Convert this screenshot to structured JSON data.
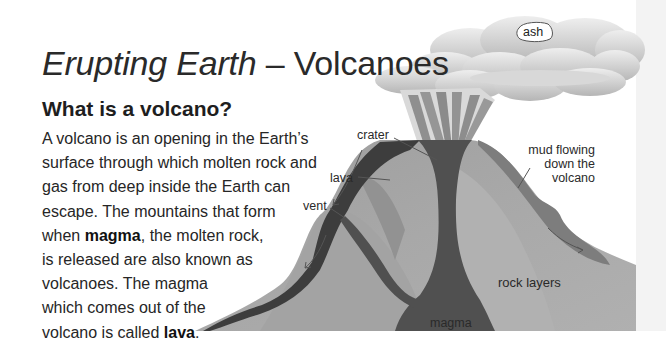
{
  "page": {
    "title_italic": "Erupting Earth",
    "title_rest": " – Volcanoes",
    "subtitle": "What is a volcano?",
    "paragraph_lines": [
      {
        "parts": [
          {
            "text": "A volcano is an opening in the Earth’s",
            "bold": false
          }
        ]
      },
      {
        "parts": [
          {
            "text": "surface through which molten rock and",
            "bold": false
          }
        ]
      },
      {
        "parts": [
          {
            "text": "gas from deep inside the Earth can",
            "bold": false
          }
        ]
      },
      {
        "parts": [
          {
            "text": "escape. The mountains that form",
            "bold": false
          }
        ]
      },
      {
        "parts": [
          {
            "text": "when ",
            "bold": false
          },
          {
            "text": "magma",
            "bold": true
          },
          {
            "text": ", the molten rock,",
            "bold": false
          }
        ]
      },
      {
        "parts": [
          {
            "text": "is released are also known as",
            "bold": false
          }
        ]
      },
      {
        "parts": [
          {
            "text": "volcanoes. The magma",
            "bold": false
          }
        ]
      },
      {
        "parts": [
          {
            "text": "which comes out of the",
            "bold": false
          }
        ]
      },
      {
        "parts": [
          {
            "text": "volcano is called ",
            "bold": false
          },
          {
            "text": "lava",
            "bold": true
          },
          {
            "text": ".",
            "bold": false
          }
        ]
      }
    ]
  },
  "diagram": {
    "labels": {
      "ash": "ash",
      "crater": "crater",
      "lava": "lava",
      "vent": "vent",
      "mud_line1": "mud flowing",
      "mud_line2": "down the",
      "mud_line3": "volcano",
      "rock_layers": "rock layers",
      "magma": "magma"
    },
    "colors": {
      "rock_outer": "#a9a9a9",
      "rock_mid": "#9a9a9a",
      "rock_inner": "#8c8c8c",
      "magma": "#4f4f4f",
      "lava": "#3d3d3d",
      "mud": "#7d7d7d",
      "ash_cloud": "#cfcfcf",
      "plume": "#9e9e9e"
    }
  }
}
